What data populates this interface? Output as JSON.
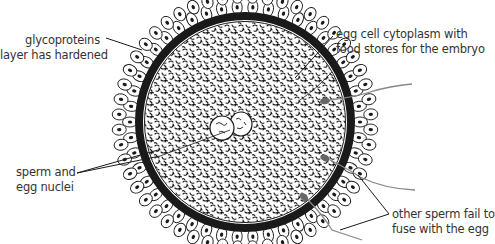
{
  "diagram": {
    "colors": {
      "ink": "#1a1a1a",
      "text": "#333333",
      "sperm_head": "#666666",
      "sperm_tail": "#888888",
      "background": "#ffffff"
    },
    "labels": [
      {
        "id": "glycoprotein",
        "lines": [
          "glycoproteins",
          "layer has hardened"
        ],
        "align": "right"
      },
      {
        "id": "cytoplasm",
        "lines": [
          "egg cell cytoplasm with",
          "food stores for the embryo"
        ],
        "align": "left"
      },
      {
        "id": "nuclei",
        "lines": [
          "sperm and",
          "egg nuclei"
        ],
        "align": "left"
      },
      {
        "id": "other_sperm",
        "lines": [
          "other sperm fail to",
          "fuse with the egg"
        ],
        "align": "left"
      }
    ]
  }
}
